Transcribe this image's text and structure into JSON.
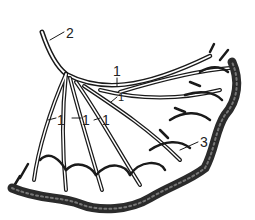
{
  "figure": {
    "type": "anatomical line drawing of a branching vessel network",
    "colors": {
      "ink": "#1a1a1a",
      "background": "#ffffff",
      "shading": "#2b2b2b"
    }
  },
  "labels": [
    {
      "id": "label-2",
      "text": "2",
      "x": 66,
      "y": 26
    },
    {
      "id": "label-1-top",
      "text": "1",
      "x": 113,
      "y": 64
    },
    {
      "id": "label-1-small-right",
      "text": "1",
      "x": 118,
      "y": 92
    },
    {
      "id": "label-1-left",
      "text": "1",
      "x": 57,
      "y": 113
    },
    {
      "id": "label-1-mid",
      "text": "1",
      "x": 82,
      "y": 113
    },
    {
      "id": "label-1-mid2",
      "text": "1",
      "x": 102,
      "y": 113
    },
    {
      "id": "label-3",
      "text": "3",
      "x": 200,
      "y": 135
    }
  ]
}
